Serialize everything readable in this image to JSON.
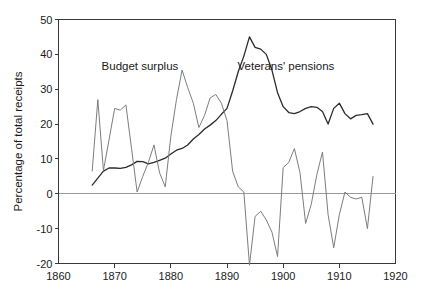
{
  "chart_data": {
    "type": "line",
    "title": "",
    "subtitle": "",
    "xlabel": "",
    "ylabel": "Percentage of total receipts",
    "xlim": [
      1860,
      1920
    ],
    "ylim": [
      -20,
      50
    ],
    "xticks": [
      1860,
      1870,
      1880,
      1890,
      1900,
      1910,
      1920
    ],
    "xtick_labels": [
      "1860",
      "1870",
      "1880",
      "1890",
      "1900",
      "1910",
      "1920"
    ],
    "yticks": [
      -20,
      -10,
      0,
      10,
      20,
      30,
      40,
      50
    ],
    "ytick_labels": [
      "-20",
      "-10",
      "0",
      "10",
      "20",
      "30",
      "40",
      "50"
    ],
    "grid": false,
    "zero_line": true,
    "legend": "annotations-inline",
    "annotations": [
      {
        "text": "Budget surplus",
        "x": 1874.5,
        "y": 35.5
      },
      {
        "text": "Veterans' pensions",
        "x": 1900.5,
        "y": 35.5
      }
    ],
    "series": [
      {
        "name": "Veterans' pensions",
        "color": "#2b2b2b",
        "width": 1.3,
        "x": [
          1866,
          1867,
          1868,
          1869,
          1870,
          1871,
          1872,
          1873,
          1874,
          1875,
          1876,
          1877,
          1878,
          1879,
          1880,
          1881,
          1882,
          1883,
          1884,
          1885,
          1886,
          1887,
          1888,
          1889,
          1890,
          1891,
          1892,
          1893,
          1894,
          1895,
          1896,
          1897,
          1898,
          1899,
          1900,
          1901,
          1902,
          1903,
          1904,
          1905,
          1906,
          1907,
          1908,
          1909,
          1910,
          1911,
          1912,
          1913,
          1914,
          1915,
          1916
        ],
        "values": [
          2.5,
          4.5,
          6.5,
          7.4,
          7.4,
          7.3,
          7.6,
          8.3,
          9.3,
          9.2,
          8.6,
          9.0,
          9.6,
          10.2,
          11.4,
          12.5,
          13.0,
          14.0,
          15.7,
          17.0,
          18.6,
          19.7,
          21.0,
          22.8,
          24.5,
          29.5,
          35.0,
          39.5,
          45.0,
          42.0,
          41.5,
          40.0,
          35.5,
          29.0,
          25.0,
          23.3,
          23.0,
          23.6,
          24.5,
          25.0,
          24.8,
          23.6,
          20.0,
          24.5,
          26.0,
          23.0,
          21.5,
          22.5,
          22.7,
          23.0,
          20.0
        ]
      },
      {
        "name": "Budget surplus",
        "color": "#7d7d7d",
        "width": 1.0,
        "x": [
          1866,
          1867,
          1868,
          1869,
          1870,
          1871,
          1872,
          1873,
          1874,
          1875,
          1876,
          1877,
          1878,
          1879,
          1880,
          1881,
          1882,
          1883,
          1884,
          1885,
          1886,
          1887,
          1888,
          1889,
          1890,
          1891,
          1892,
          1893,
          1894,
          1895,
          1896,
          1897,
          1898,
          1899,
          1900,
          1901,
          1902,
          1903,
          1904,
          1905,
          1906,
          1907,
          1908,
          1909,
          1910,
          1911,
          1912,
          1913,
          1914,
          1915,
          1916
        ],
        "values": [
          6.5,
          27.0,
          6.7,
          15.5,
          24.5,
          24.0,
          25.5,
          13.0,
          0.5,
          5.0,
          9.0,
          14.0,
          6.0,
          2.0,
          16.5,
          27.0,
          35.5,
          30.5,
          26.0,
          19.0,
          22.5,
          27.5,
          28.5,
          26.0,
          21.0,
          6.5,
          2.0,
          0.5,
          -20.5,
          -6.5,
          -5.0,
          -7.5,
          -11.0,
          -18.0,
          7.5,
          9.0,
          13.0,
          6.0,
          -8.5,
          -3.0,
          5.5,
          12.0,
          -6.0,
          -15.5,
          -6.0,
          0.5,
          -1.0,
          -1.5,
          -1.0,
          -10.0,
          5.0
        ]
      }
    ]
  },
  "axis": {
    "ylabel": "Percentage of total receipts"
  }
}
